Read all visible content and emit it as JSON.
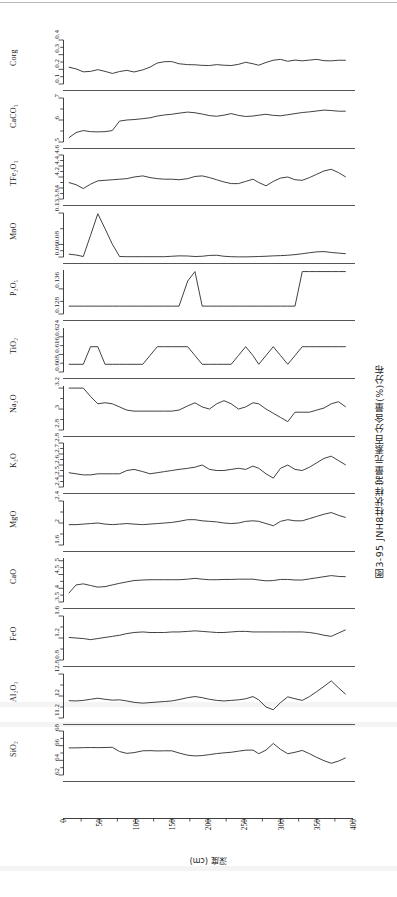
{
  "figure": {
    "caption": "图3-95  JNH8柱状样常量元素百分含量(%)分布",
    "x_axis_title": "深度 (cm)",
    "x_ticks": [
      "0",
      "50",
      "100",
      "150",
      "200",
      "250",
      "300",
      "350",
      "400"
    ],
    "line_color": "#2b2b2b",
    "background_color": "#ffffff"
  },
  "chart_data": {
    "type": "line",
    "title": "图3-95  JNH8柱状样常量元素百分含量(%)分布",
    "xlabel": "深度 (cm)",
    "ylabel": "",
    "grid": false,
    "legend": "none",
    "xlim": [
      0,
      400
    ],
    "x_ticks": [
      0,
      50,
      100,
      150,
      200,
      250,
      300,
      350,
      400
    ],
    "x": [
      8,
      18,
      28,
      38,
      48,
      58,
      68,
      78,
      88,
      98,
      110,
      120,
      130,
      140,
      150,
      160,
      172,
      182,
      192,
      202,
      212,
      222,
      232,
      242,
      252,
      262,
      270,
      280,
      290,
      300,
      310,
      320,
      330,
      340,
      350,
      360,
      370,
      380,
      390
    ],
    "panels": [
      {
        "name": "Corg",
        "label": "Corg",
        "ylim": [
          0.1,
          0.4
        ],
        "y_ticks": [
          0.1,
          0.2,
          0.3,
          0.4
        ],
        "y_tick_labels": [
          "0.1",
          "0.2",
          "0.3",
          "0.4"
        ],
        "values": [
          0.215,
          0.203,
          0.183,
          0.186,
          0.198,
          0.186,
          0.172,
          0.185,
          0.193,
          0.182,
          0.196,
          0.215,
          0.243,
          0.252,
          0.253,
          0.238,
          0.232,
          0.231,
          0.227,
          0.226,
          0.232,
          0.228,
          0.226,
          0.234,
          0.248,
          0.238,
          0.228,
          0.247,
          0.262,
          0.268,
          0.255,
          0.263,
          0.258,
          0.263,
          0.268,
          0.259,
          0.258,
          0.262,
          0.262
        ]
      },
      {
        "name": "CaCO3",
        "label": "CaCO₃",
        "ylim": [
          5,
          7
        ],
        "y_ticks": [
          5,
          6,
          7
        ],
        "y_tick_labels": [
          "5",
          "6",
          "7"
        ],
        "values": [
          5.19,
          5.43,
          5.52,
          5.47,
          5.46,
          5.47,
          5.52,
          5.95,
          6.0,
          6.02,
          6.06,
          6.1,
          6.18,
          6.23,
          6.26,
          6.31,
          6.36,
          6.33,
          6.27,
          6.2,
          6.17,
          6.22,
          6.29,
          6.21,
          6.16,
          6.18,
          6.22,
          6.26,
          6.21,
          6.19,
          6.24,
          6.29,
          6.34,
          6.37,
          6.41,
          6.45,
          6.43,
          6.4,
          6.4
        ]
      },
      {
        "name": "TFe2O3",
        "label": "TFe₂O₃",
        "ylim": [
          3.8,
          4.6
        ],
        "y_ticks": [
          3.8,
          4.0,
          4.2,
          4.4,
          4.6
        ],
        "y_tick_labels": [
          "3.8",
          "4",
          "4.2",
          "4.4",
          "4.6"
        ],
        "values": [
          4.1,
          4.06,
          3.99,
          4.07,
          4.13,
          4.14,
          4.15,
          4.16,
          4.17,
          4.2,
          4.22,
          4.19,
          4.17,
          4.16,
          4.16,
          4.15,
          4.17,
          4.21,
          4.22,
          4.19,
          4.15,
          4.11,
          4.08,
          4.08,
          4.12,
          4.16,
          4.1,
          4.04,
          4.12,
          4.18,
          4.2,
          4.15,
          4.14,
          4.19,
          4.25,
          4.31,
          4.34,
          4.28,
          4.2
        ]
      },
      {
        "name": "MnO",
        "label": "MnO",
        "ylim": [
          0.06,
          0.13
        ],
        "y_ticks": [
          0.06,
          0.08,
          0.13
        ],
        "y_tick_labels": [
          "0.06",
          "0.08",
          "0.13"
        ],
        "values": [
          0.0645,
          0.0632,
          0.0608,
          0.0945,
          0.1288,
          0.105,
          0.0805,
          0.0608,
          0.0605,
          0.0605,
          0.0605,
          0.0605,
          0.0605,
          0.0605,
          0.0612,
          0.0618,
          0.0616,
          0.0608,
          0.0612,
          0.0625,
          0.0628,
          0.0612,
          0.0605,
          0.0602,
          0.0602,
          0.0605,
          0.0608,
          0.0612,
          0.0618,
          0.0622,
          0.0628,
          0.0638,
          0.0652,
          0.0668,
          0.0682,
          0.0686,
          0.0672,
          0.0662,
          0.0652
        ]
      },
      {
        "name": "P2O5",
        "label": "P₂O₅",
        "ylim": [
          0.128,
          0.142
        ],
        "y_ticks": [
          0.128,
          0.136
        ],
        "y_tick_labels": [
          "0.128",
          "0.136"
        ],
        "values": [
          0.1305,
          0.1305,
          0.1305,
          0.1305,
          0.1305,
          0.1305,
          0.1305,
          0.1305,
          0.1305,
          0.1305,
          0.1305,
          0.1305,
          0.1305,
          0.1305,
          0.1305,
          0.1305,
          0.1385,
          0.1415,
          0.1305,
          0.1305,
          0.1305,
          0.1305,
          0.1305,
          0.1305,
          0.1305,
          0.1305,
          0.1305,
          0.1305,
          0.1305,
          0.1305,
          0.1305,
          0.1305,
          0.1415,
          0.1415,
          0.1415,
          0.1415,
          0.1415,
          0.1415,
          0.1415
        ]
      },
      {
        "name": "TiO2",
        "label": "TiO₂",
        "ylim": [
          0.608,
          0.628
        ],
        "y_ticks": [
          0.608,
          0.616,
          0.624
        ],
        "y_tick_labels": [
          "0.608",
          "0.616",
          "0.624"
        ],
        "values": [
          0.6115,
          0.6115,
          0.6115,
          0.6195,
          0.6195,
          0.6115,
          0.6115,
          0.6115,
          0.6115,
          0.6115,
          0.6115,
          0.6155,
          0.6195,
          0.6195,
          0.6195,
          0.6195,
          0.6195,
          0.6155,
          0.6115,
          0.6115,
          0.6115,
          0.6115,
          0.6115,
          0.6155,
          0.6195,
          0.6155,
          0.6115,
          0.6155,
          0.6195,
          0.6155,
          0.6115,
          0.6155,
          0.6195,
          0.6195,
          0.6195,
          0.6195,
          0.6195,
          0.6195,
          0.6195
        ]
      },
      {
        "name": "Na2O",
        "label": "Na₂O",
        "ylim": [
          2.8,
          3.22
        ],
        "y_ticks": [
          2.8,
          3.0,
          3.2
        ],
        "y_tick_labels": [
          "2.8",
          "3",
          "3.2"
        ],
        "values": [
          3.2,
          3.2,
          3.2,
          3.12,
          3.05,
          3.06,
          3.05,
          3.02,
          2.99,
          2.98,
          2.98,
          2.98,
          2.98,
          2.98,
          2.98,
          2.99,
          3.03,
          3.06,
          3.02,
          3.0,
          3.05,
          3.08,
          3.05,
          3.0,
          3.02,
          3.06,
          3.05,
          3.0,
          2.96,
          2.92,
          2.88,
          2.97,
          2.97,
          2.97,
          2.99,
          3.01,
          3.05,
          3.07,
          3.02
        ]
      },
      {
        "name": "K2O",
        "label": "K₂O",
        "ylim": [
          2.4,
          2.8
        ],
        "y_ticks": [
          2.4,
          2.5,
          2.6,
          2.7,
          2.8
        ],
        "y_tick_labels": [
          "2.4",
          "2.5",
          "2.6",
          "2.7",
          "2.8"
        ],
        "values": [
          2.53,
          2.52,
          2.51,
          2.51,
          2.52,
          2.52,
          2.52,
          2.52,
          2.55,
          2.56,
          2.54,
          2.52,
          2.53,
          2.54,
          2.55,
          2.56,
          2.57,
          2.58,
          2.6,
          2.56,
          2.55,
          2.55,
          2.56,
          2.57,
          2.56,
          2.59,
          2.57,
          2.52,
          2.48,
          2.57,
          2.6,
          2.56,
          2.55,
          2.58,
          2.62,
          2.66,
          2.68,
          2.64,
          2.6
        ]
      },
      {
        "name": "MgO",
        "label": "MgO",
        "ylim": [
          1.6,
          2.4
        ],
        "y_ticks": [
          1.6,
          2.0,
          2.4
        ],
        "y_tick_labels": [
          "1.6",
          "2",
          "2.4"
        ],
        "values": [
          1.97,
          1.97,
          1.98,
          1.99,
          2.0,
          1.98,
          1.97,
          1.98,
          1.99,
          1.98,
          1.97,
          1.98,
          1.99,
          2.0,
          2.01,
          2.03,
          2.06,
          2.06,
          2.04,
          2.03,
          2.02,
          2.0,
          1.99,
          2.0,
          2.03,
          2.04,
          2.03,
          1.99,
          1.95,
          2.03,
          2.06,
          2.04,
          2.04,
          2.08,
          2.12,
          2.16,
          2.19,
          2.14,
          2.1
        ]
      },
      {
        "name": "CaO",
        "label": "CaO",
        "ylim": [
          3.5,
          5.1
        ],
        "y_ticks": [
          3.5,
          4.0,
          4.5,
          5.0
        ],
        "y_tick_labels": [
          "3.5",
          "4",
          "4.5",
          "5"
        ],
        "values": [
          3.82,
          4.12,
          4.16,
          4.1,
          4.04,
          4.06,
          4.12,
          4.18,
          4.23,
          4.28,
          4.3,
          4.31,
          4.31,
          4.31,
          4.31,
          4.31,
          4.33,
          4.36,
          4.33,
          4.31,
          4.31,
          4.32,
          4.32,
          4.33,
          4.33,
          4.33,
          4.3,
          4.27,
          4.28,
          4.32,
          4.32,
          4.3,
          4.3,
          4.34,
          4.38,
          4.42,
          4.46,
          4.43,
          4.42
        ]
      },
      {
        "name": "FeO",
        "label": "FeO",
        "ylim": [
          0.8,
          1.6
        ],
        "y_ticks": [
          0.8,
          1.2,
          1.6
        ],
        "y_tick_labels": [
          "0.8",
          "1.2",
          "1.6"
        ],
        "values": [
          1.21,
          1.2,
          1.19,
          1.17,
          1.19,
          1.21,
          1.23,
          1.25,
          1.28,
          1.3,
          1.31,
          1.3,
          1.3,
          1.3,
          1.31,
          1.31,
          1.32,
          1.33,
          1.32,
          1.31,
          1.3,
          1.3,
          1.31,
          1.32,
          1.32,
          1.31,
          1.31,
          1.31,
          1.31,
          1.31,
          1.31,
          1.31,
          1.31,
          1.3,
          1.28,
          1.25,
          1.23,
          1.29,
          1.35
        ]
      },
      {
        "name": "Al2O3",
        "label": "Al₂O₃",
        "ylim": [
          11.2,
          12.8
        ],
        "y_ticks": [
          11.2,
          12.0,
          12.8
        ],
        "y_tick_labels": [
          "11.2",
          "12",
          "12.8"
        ],
        "values": [
          11.83,
          11.82,
          11.84,
          11.88,
          11.92,
          11.88,
          11.85,
          11.86,
          11.82,
          11.77,
          11.74,
          11.76,
          11.78,
          11.8,
          11.82,
          11.87,
          11.94,
          11.98,
          11.94,
          11.88,
          11.84,
          11.82,
          11.84,
          11.86,
          11.9,
          11.98,
          11.86,
          11.6,
          11.5,
          11.76,
          11.97,
          11.9,
          11.84,
          11.98,
          12.16,
          12.35,
          12.55,
          12.3,
          12.06
        ]
      },
      {
        "name": "SiO2",
        "label": "SiO₂",
        "ylim": [
          62,
          68
        ],
        "y_ticks": [
          62,
          64,
          66,
          68
        ],
        "y_tick_labels": [
          "62",
          "64",
          "66",
          "68"
        ],
        "values": [
          65.7,
          65.7,
          65.73,
          65.75,
          65.73,
          65.75,
          65.78,
          65.2,
          64.95,
          65.05,
          65.3,
          65.32,
          65.28,
          65.3,
          65.3,
          65.0,
          64.7,
          64.6,
          64.65,
          64.78,
          64.92,
          65.02,
          65.1,
          65.25,
          65.38,
          65.4,
          64.9,
          65.4,
          66.3,
          65.5,
          64.9,
          65.1,
          65.35,
          64.9,
          64.4,
          63.95,
          63.6,
          63.9,
          64.35
        ]
      }
    ]
  }
}
